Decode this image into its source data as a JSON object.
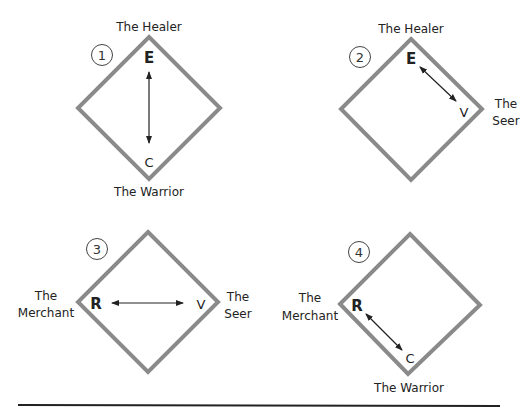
{
  "colors": {
    "diamond_stroke": "#8a8a8a",
    "text": "#222222",
    "arrow": "#222222",
    "rule": "#222222"
  },
  "panels": [
    {
      "number": "1",
      "top_label": "The Healer",
      "bottom_label": "The Warrior",
      "vertex_start": "E",
      "vertex_end": "C",
      "arrow_direction": "vertical"
    },
    {
      "number": "2",
      "top_label": "The Healer",
      "right_label_line1": "The",
      "right_label_line2": "Seer",
      "vertex_start": "E",
      "vertex_end": "V",
      "arrow_direction": "top-to-right"
    },
    {
      "number": "3",
      "left_label_line1": "The",
      "left_label_line2": "Merchant",
      "right_label_line1": "The",
      "right_label_line2": "Seer",
      "vertex_start": "R",
      "vertex_end": "V",
      "arrow_direction": "horizontal"
    },
    {
      "number": "4",
      "left_label_line1": "The",
      "left_label_line2": "Merchant",
      "bottom_label": "The Warrior",
      "vertex_start": "R",
      "vertex_end": "C",
      "arrow_direction": "left-to-bottom"
    }
  ]
}
